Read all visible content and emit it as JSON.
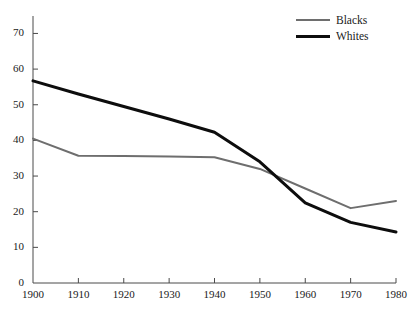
{
  "chart_data": {
    "type": "line",
    "title": "",
    "subtitle": "",
    "xlabel": "",
    "ylabel": "",
    "x": [
      1900,
      1910,
      1920,
      1930,
      1940,
      1950,
      1960,
      1970,
      1980
    ],
    "xlim": [
      1900,
      1980
    ],
    "ylim": [
      0,
      75
    ],
    "grid": false,
    "legend_position": "top-right",
    "xticks": [
      "1900",
      "1910",
      "1920",
      "1930",
      "1940",
      "1950",
      "1960",
      "1970",
      "1980"
    ],
    "yticks": [
      "0",
      "10",
      "20",
      "30",
      "40",
      "50",
      "60",
      "70"
    ],
    "series": [
      {
        "name": "Blacks",
        "color": "#6e6e6e",
        "width": 2,
        "values": [
          40.5,
          35.7,
          35.6,
          35.5,
          35.3,
          32.0,
          26.5,
          21.0,
          23.0
        ]
      },
      {
        "name": "Whites",
        "color": "#0d0d0d",
        "width": 3,
        "values": [
          56.7,
          53.0,
          49.5,
          46.0,
          42.3,
          34.0,
          22.5,
          17.0,
          14.3
        ]
      }
    ]
  },
  "legend": {
    "items": [
      {
        "label": "Blacks",
        "swatch": "line-swatch-gray"
      },
      {
        "label": "Whites",
        "swatch": "line-swatch-black"
      }
    ]
  },
  "axes": {
    "y": {
      "ticks": [
        {
          "label": "70",
          "value": 70
        },
        {
          "label": "60",
          "value": 60
        },
        {
          "label": "50",
          "value": 50
        },
        {
          "label": "40",
          "value": 40
        },
        {
          "label": "30",
          "value": 30
        },
        {
          "label": "20",
          "value": 20
        },
        {
          "label": "10",
          "value": 10
        },
        {
          "label": "0",
          "value": 0
        }
      ]
    },
    "x": {
      "ticks": [
        {
          "label": "1900",
          "value": 1900
        },
        {
          "label": "1910",
          "value": 1910
        },
        {
          "label": "1920",
          "value": 1920
        },
        {
          "label": "1930",
          "value": 1930
        },
        {
          "label": "1940",
          "value": 1940
        },
        {
          "label": "1950",
          "value": 1950
        },
        {
          "label": "1960",
          "value": 1960
        },
        {
          "label": "1970",
          "value": 1970
        },
        {
          "label": "1980",
          "value": 1980
        }
      ]
    }
  },
  "colors": {
    "background": "#ffffff",
    "axis": "#4a4a4a",
    "text": "#1a1a1a",
    "blacks_series": "#6e6e6e",
    "whites_series": "#0d0d0d"
  }
}
